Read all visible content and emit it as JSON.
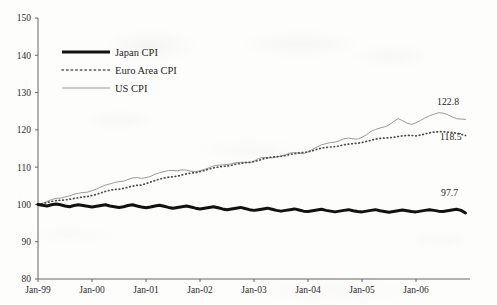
{
  "chart_data": {
    "type": "line",
    "title": "",
    "subtitle": "",
    "xlabel": "",
    "ylabel": "",
    "ylim": [
      80,
      150
    ],
    "y_ticks": [
      80,
      90,
      100,
      110,
      120,
      130,
      140,
      150
    ],
    "x_ticks": [
      "Jan-99",
      "Jan-00",
      "Jan-01",
      "Jan-02",
      "Jan-03",
      "Jan-04",
      "Jan-05",
      "Jan-06"
    ],
    "x_start": "Jan-99",
    "x_end": "Dec-06",
    "grid": false,
    "legend_position": "upper-left",
    "base_index": 100,
    "end_labels": [
      {
        "series": "US CPI",
        "value": "122.8"
      },
      {
        "series": "Euro Area CPI",
        "value": "118.5"
      },
      {
        "series": "Japan CPI",
        "value": "97.7"
      }
    ],
    "series": [
      {
        "name": "Japan CPI",
        "style": "solid-thick",
        "color": "#111111",
        "values": [
          100.0,
          99.8,
          99.6,
          99.9,
          100.1,
          99.9,
          99.6,
          99.4,
          99.7,
          99.9,
          99.7,
          99.5,
          99.3,
          99.5,
          99.7,
          99.9,
          99.6,
          99.4,
          99.2,
          99.4,
          99.7,
          99.9,
          99.6,
          99.3,
          99.1,
          99.3,
          99.6,
          99.8,
          99.5,
          99.2,
          99.0,
          99.2,
          99.4,
          99.6,
          99.3,
          99.0,
          98.8,
          99.0,
          99.2,
          99.4,
          99.1,
          98.8,
          98.6,
          98.8,
          99.0,
          99.2,
          98.9,
          98.6,
          98.4,
          98.6,
          98.8,
          99.0,
          98.7,
          98.4,
          98.2,
          98.4,
          98.6,
          98.8,
          98.5,
          98.2,
          98.1,
          98.3,
          98.5,
          98.7,
          98.4,
          98.2,
          98.0,
          98.2,
          98.4,
          98.6,
          98.3,
          98.1,
          98.0,
          98.2,
          98.4,
          98.6,
          98.3,
          98.1,
          97.9,
          98.1,
          98.3,
          98.5,
          98.3,
          98.1,
          98.0,
          98.2,
          98.4,
          98.6,
          98.4,
          98.2,
          98.1,
          98.3,
          98.5,
          98.7,
          98.4,
          97.7
        ]
      },
      {
        "name": "Euro Area CPI",
        "style": "dotted",
        "color": "#4a4a4a",
        "values": [
          100.0,
          100.2,
          100.5,
          100.8,
          101.0,
          101.1,
          101.2,
          101.4,
          101.6,
          101.8,
          102.0,
          102.1,
          102.4,
          102.7,
          103.1,
          103.5,
          103.8,
          104.0,
          104.1,
          104.3,
          104.6,
          104.9,
          105.1,
          105.2,
          105.6,
          106.0,
          106.4,
          106.8,
          107.1,
          107.3,
          107.4,
          107.6,
          107.9,
          108.2,
          108.4,
          108.5,
          108.8,
          109.1,
          109.5,
          109.8,
          110.0,
          110.2,
          110.3,
          110.5,
          110.8,
          111.0,
          111.2,
          111.3,
          111.5,
          111.8,
          112.2,
          112.5,
          112.7,
          112.8,
          112.9,
          113.1,
          113.4,
          113.6,
          113.8,
          113.9,
          114.1,
          114.4,
          114.8,
          115.1,
          115.3,
          115.4,
          115.5,
          115.7,
          116.0,
          116.2,
          116.3,
          116.4,
          116.6,
          116.9,
          117.2,
          117.5,
          117.7,
          117.8,
          117.9,
          118.0,
          118.2,
          118.4,
          118.5,
          118.5,
          118.4,
          118.6,
          118.9,
          119.2,
          119.4,
          119.5,
          119.5,
          119.4,
          119.3,
          119.1,
          118.8,
          118.5
        ]
      },
      {
        "name": "US CPI",
        "style": "solid-thin",
        "color": "#9a9a9a",
        "values": [
          100.0,
          100.3,
          100.8,
          101.3,
          101.6,
          101.7,
          102.0,
          102.3,
          102.7,
          103.0,
          103.2,
          103.3,
          103.7,
          104.1,
          104.7,
          105.2,
          105.5,
          105.9,
          106.1,
          106.2,
          106.7,
          107.1,
          107.2,
          107.0,
          107.2,
          107.5,
          108.1,
          108.5,
          108.8,
          109.1,
          109.1,
          109.0,
          109.3,
          109.2,
          108.9,
          108.8,
          109.0,
          109.4,
          109.8,
          110.3,
          110.5,
          110.6,
          110.7,
          110.9,
          111.2,
          111.3,
          111.3,
          111.2,
          111.6,
          112.3,
          112.6,
          112.5,
          112.5,
          112.7,
          113.0,
          113.3,
          113.8,
          113.9,
          113.8,
          113.6,
          114.1,
          114.8,
          115.4,
          116.0,
          116.3,
          116.6,
          116.7,
          117.1,
          117.6,
          117.8,
          117.6,
          117.5,
          118.0,
          118.7,
          119.6,
          120.1,
          120.5,
          120.8,
          121.3,
          122.2,
          123.0,
          122.5,
          121.8,
          121.5,
          121.9,
          122.5,
          123.2,
          123.8,
          124.2,
          124.6,
          124.5,
          124.1,
          123.5,
          123.0,
          122.9,
          122.8
        ]
      }
    ]
  },
  "legend": {
    "items": [
      {
        "label": "Japan CPI",
        "style": "solid-thick",
        "color": "#111111"
      },
      {
        "label": "Euro Area CPI",
        "style": "dotted",
        "color": "#4a4a4a"
      },
      {
        "label": "US CPI",
        "style": "solid-thin",
        "color": "#9a9a9a"
      }
    ]
  },
  "axes": {
    "y_labels": [
      "150",
      "140",
      "130",
      "120",
      "110",
      "100",
      "90",
      "80"
    ],
    "x_labels": [
      "Jan-99",
      "Jan-00",
      "Jan-01",
      "Jan-02",
      "Jan-03",
      "Jan-04",
      "Jan-05",
      "Jan-06"
    ]
  },
  "end_labels": {
    "us": "122.8",
    "euro": "118.5",
    "japan": "97.7"
  }
}
